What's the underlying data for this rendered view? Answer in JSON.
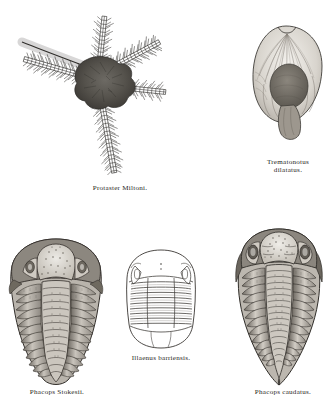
{
  "plate": {
    "background_color": "#ffffff",
    "ink_color": "#2a2724",
    "style": "steel-engraving"
  },
  "figures": [
    {
      "id": "protaster",
      "caption": "Protaster Miltoni.",
      "subject": "brittle-star (ophiuroid) fossil with five spined arms radiating from a central disc",
      "arms": 5
    },
    {
      "id": "trematonotus",
      "caption": "Trematonotus\ndilatatus.",
      "caption_line_1": "Trematonotus",
      "caption_line_2": "dilatatus.",
      "subject": "broad gastropod shell with radiating striae and a slit notch at the margin"
    },
    {
      "id": "trilobite-left",
      "caption": "Phacops Stokesii.",
      "subject": "trilobite with granulated glabella and broad segmented thorax"
    },
    {
      "id": "illaenus",
      "caption": "Illaenus barriensis.",
      "subject": "smooth outline-drawn trilobite with rounded cephalon and pygidium"
    },
    {
      "id": "trilobite-right",
      "caption": "Phacops caudatus.",
      "subject": "trilobite with large compound eyes, long genal spines and tapering pygidium"
    }
  ]
}
